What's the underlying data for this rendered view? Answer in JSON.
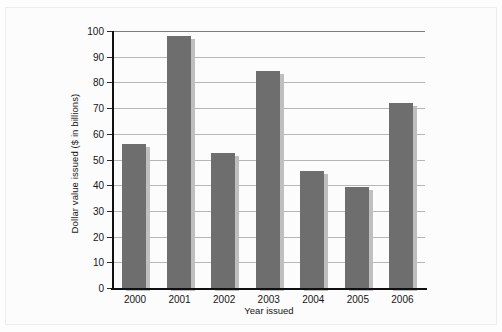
{
  "chart_data": {
    "type": "bar",
    "title": "",
    "subtitle": "",
    "xlabel": "Year issued",
    "ylabel": "Dollar value issued ($ in billions)",
    "categories": [
      "2000",
      "2001",
      "2002",
      "2003",
      "2004",
      "2005",
      "2006"
    ],
    "values": [
      56,
      98,
      52.5,
      84.5,
      45.5,
      39.5,
      72
    ],
    "series": [
      {
        "name": "Dollar value issued",
        "values": [
          56,
          98,
          52.5,
          84.5,
          45.5,
          39.5,
          72
        ]
      }
    ],
    "ylim": [
      0,
      100
    ],
    "ytick_labels": [
      "0",
      "10",
      "20",
      "30",
      "40",
      "50",
      "60",
      "70",
      "80",
      "90",
      "100"
    ],
    "ytick_values": [
      0,
      10,
      20,
      30,
      40,
      50,
      60,
      70,
      80,
      90,
      100
    ],
    "grid": "horizontal",
    "legend": "none",
    "annotations": [],
    "colors": {
      "bar": "#6e6e6e",
      "bar_shadow": "#bfbfbf",
      "gridline": "#b6b6b6",
      "axis": "#101010",
      "text": "#151515",
      "background": "#fdfdfd"
    }
  }
}
